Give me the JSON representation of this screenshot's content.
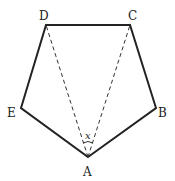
{
  "diagram": {
    "type": "pentagon",
    "vertices": [
      {
        "label": "A",
        "x": 88,
        "y": 157
      },
      {
        "label": "B",
        "x": 156,
        "y": 108
      },
      {
        "label": "C",
        "x": 130,
        "y": 25
      },
      {
        "label": "D",
        "x": 46,
        "y": 25
      },
      {
        "label": "E",
        "x": 21,
        "y": 108
      }
    ],
    "dashed_diagonals": [
      [
        "A",
        "D"
      ],
      [
        "A",
        "C"
      ]
    ],
    "angle_label": "x",
    "labels": {
      "A": "A",
      "B": "B",
      "C": "C",
      "D": "D",
      "E": "E"
    }
  }
}
